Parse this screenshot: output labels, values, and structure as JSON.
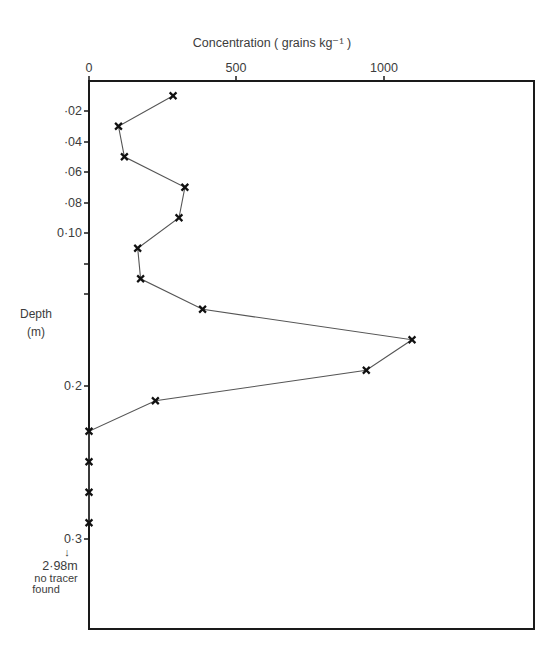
{
  "chart_data": {
    "type": "line",
    "title": "",
    "xlabel": "Concentration  ( grains  kg⁻¹ )",
    "ylabel": "Depth",
    "ylabel_unit": "(m)",
    "x_axis_position": "top",
    "y_axis_inverted": true,
    "xlim": [
      0,
      1500
    ],
    "ylim": [
      0,
      0.36
    ],
    "x_ticks": [
      {
        "value": 0,
        "label": "0"
      },
      {
        "value": 500,
        "label": "500"
      },
      {
        "value": 1000,
        "label": "1000"
      }
    ],
    "y_ticks": [
      {
        "value": 0.02,
        "label": "·02"
      },
      {
        "value": 0.04,
        "label": "·04"
      },
      {
        "value": 0.06,
        "label": "·06"
      },
      {
        "value": 0.08,
        "label": "·08"
      },
      {
        "value": 0.1,
        "label": "0·10"
      },
      {
        "value": 0.12,
        "label": ""
      },
      {
        "value": 0.14,
        "label": ""
      },
      {
        "value": 0.2,
        "label": "0·2"
      },
      {
        "value": 0.3,
        "label": "0·3"
      }
    ],
    "grid": false,
    "legend": null,
    "marker": "x",
    "series": [
      {
        "name": "Tracer concentration",
        "points": [
          {
            "depth": 0.01,
            "concentration": 285
          },
          {
            "depth": 0.03,
            "concentration": 100
          },
          {
            "depth": 0.05,
            "concentration": 120
          },
          {
            "depth": 0.07,
            "concentration": 325
          },
          {
            "depth": 0.09,
            "concentration": 305
          },
          {
            "depth": 0.11,
            "concentration": 165
          },
          {
            "depth": 0.13,
            "concentration": 175
          },
          {
            "depth": 0.15,
            "concentration": 385
          },
          {
            "depth": 0.17,
            "concentration": 1095
          },
          {
            "depth": 0.19,
            "concentration": 940
          },
          {
            "depth": 0.21,
            "concentration": 225
          },
          {
            "depth": 0.23,
            "concentration": 0
          },
          {
            "depth": 0.25,
            "concentration": 0
          },
          {
            "depth": 0.27,
            "concentration": 0
          },
          {
            "depth": 0.29,
            "concentration": 0
          }
        ]
      }
    ],
    "annotations": [
      {
        "text": "2·98m",
        "note_lines": [
          "no tracer",
          "found"
        ],
        "arrow": "down",
        "position": "below 0·3 tick"
      }
    ]
  },
  "labels": {
    "xlabel": "Concentration  ( grains  kg⁻¹ )",
    "ylabel": "Depth",
    "yunit": "(m)",
    "xt0": "0",
    "xt500": "500",
    "xt1000": "1000",
    "yt02": "·02",
    "yt04": "·04",
    "yt06": "·06",
    "yt08": "·08",
    "yt10": "0·10",
    "yt20": "0·2",
    "yt30": "0·3",
    "note_depth": "2·98m",
    "note_line1": "no tracer",
    "note_line2": "found",
    "note_arrow": "↓"
  },
  "colors": {
    "axis": "#1a1a1a",
    "line": "#555555",
    "marker": "#111111",
    "text": "#3c3c3c"
  }
}
